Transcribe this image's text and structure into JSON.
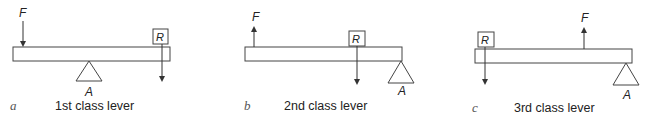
{
  "diagram": {
    "colors": {
      "stroke": "#333333",
      "background": "#ffffff"
    },
    "panels": [
      {
        "id": "a",
        "letter": "a",
        "caption": "1st class lever",
        "labels": {
          "force": "F",
          "resistance": "R",
          "fulcrum": "A"
        },
        "arrangement": "fulcrum between force and resistance",
        "force_direction": "down",
        "resistance_direction": "down"
      },
      {
        "id": "b",
        "letter": "b",
        "caption": "2nd class lever",
        "labels": {
          "force": "F",
          "resistance": "R",
          "fulcrum": "A"
        },
        "arrangement": "resistance between force and fulcrum",
        "force_direction": "up",
        "resistance_direction": "down"
      },
      {
        "id": "c",
        "letter": "c",
        "caption": "3rd class lever",
        "labels": {
          "force": "F",
          "resistance": "R",
          "fulcrum": "A"
        },
        "arrangement": "force between resistance and fulcrum",
        "force_direction": "up",
        "resistance_direction": "down"
      }
    ]
  }
}
